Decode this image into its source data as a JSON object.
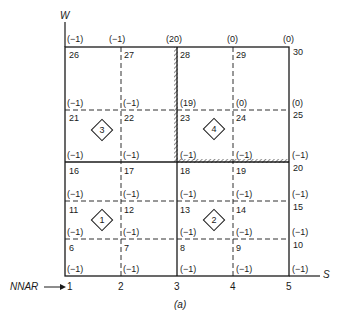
{
  "axes": {
    "vertical": "W",
    "horizontal": "S",
    "nnar_label": "NNAR"
  },
  "x_ticks": [
    "1",
    "2",
    "3",
    "4",
    "5"
  ],
  "caption": "(a)",
  "nodes": [
    {
      "n": "1",
      "v": null
    },
    {
      "n": "2",
      "v": null
    },
    {
      "n": "3",
      "v": null
    },
    {
      "n": "4",
      "v": null
    },
    {
      "n": "5",
      "v": null
    },
    {
      "n": "6",
      "v": "(−1)"
    },
    {
      "n": "7",
      "v": "(−1)"
    },
    {
      "n": "8",
      "v": "(−1)"
    },
    {
      "n": "9",
      "v": "(−1)"
    },
    {
      "n": "10",
      "v": "(−1)"
    },
    {
      "n": "11",
      "v": "(−1)"
    },
    {
      "n": "12",
      "v": "(−1)"
    },
    {
      "n": "13",
      "v": "(−1)"
    },
    {
      "n": "14",
      "v": "(−1)"
    },
    {
      "n": "15",
      "v": "(−1)"
    },
    {
      "n": "16",
      "v": "(−1)"
    },
    {
      "n": "17",
      "v": "(−1)"
    },
    {
      "n": "18",
      "v": "(−1)"
    },
    {
      "n": "19",
      "v": "(−1)"
    },
    {
      "n": "20",
      "v": "(−1)"
    },
    {
      "n": "21",
      "v": "(−1)"
    },
    {
      "n": "22",
      "v": "(−1)"
    },
    {
      "n": "23",
      "v": "(−1)"
    },
    {
      "n": "24",
      "v": "(−1)"
    },
    {
      "n": "25",
      "v": "(−1)"
    },
    {
      "n": "26",
      "v": "(−1)"
    },
    {
      "n": "27",
      "v": "(−1)"
    },
    {
      "n": "28",
      "v": "(19)"
    },
    {
      "n": "29",
      "v": "(0)"
    },
    {
      "n": "30",
      "v": "(0)"
    }
  ],
  "top_values": [
    "(−1)",
    "(−1)",
    "(20)",
    "(0)",
    "(0)"
  ],
  "zones": [
    "1",
    "2",
    "3",
    "4"
  ],
  "labels": {
    "n6": "6",
    "n7": "7",
    "n8": "8",
    "n9": "9",
    "n10": "10",
    "n11": "11",
    "n12": "12",
    "n13": "13",
    "n14": "14",
    "n15": "15",
    "n16": "16",
    "n17": "17",
    "n18": "18",
    "n19": "19",
    "n20": "20",
    "n21": "21",
    "n22": "22",
    "n23": "23",
    "n24": "24",
    "n25": "25",
    "n26": "26",
    "n27": "27",
    "n28": "28",
    "n29": "29",
    "n30": "30"
  },
  "values": {
    "neg": "(−1)",
    "v19": "(19)",
    "v20": "(20)",
    "v0": "(0)"
  }
}
